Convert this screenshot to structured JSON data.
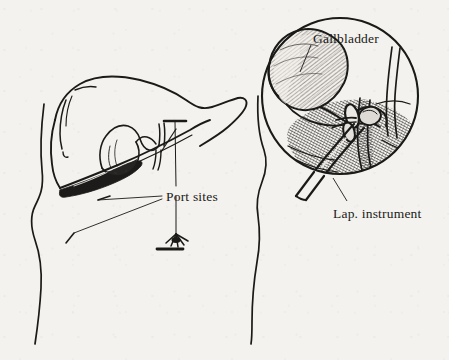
{
  "figure": {
    "background_color": "#f4f2ee",
    "ink_color": "#1a1a18",
    "width": 449,
    "height": 360
  },
  "labels": {
    "gallbladder": "Gallbladder",
    "port_sites": "Port sites",
    "lap_instrument": "Lap. instrument"
  },
  "panels": {
    "left": {
      "name": "torso-liver-view",
      "description": "Lateral torso outline with liver, gallbladder and two port site markers"
    },
    "right": {
      "name": "endoscopic-circle-view",
      "description": "Circular magnified endoscopic view of gallbladder, cystic duct clips and laparoscopic instrument"
    }
  }
}
